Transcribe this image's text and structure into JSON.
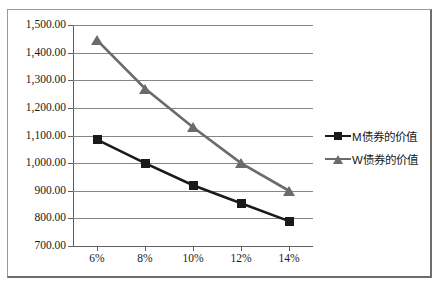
{
  "chart_data": {
    "type": "line",
    "title": "",
    "xlabel": "",
    "ylabel": "",
    "categories": [
      "6%",
      "8%",
      "10%",
      "12%",
      "14%"
    ],
    "ylim": [
      700,
      1500
    ],
    "ytick_step": 100,
    "ytick_labels": [
      "1,500.00",
      "1,400.00",
      "1,300.00",
      "1,200.00",
      "1,100.00",
      "1,000.00",
      "900.00",
      "800.00",
      "700.00"
    ],
    "ytick_values": [
      1500,
      1400,
      1300,
      1200,
      1100,
      1000,
      900,
      800,
      700
    ],
    "grid": true,
    "legend_position": "right",
    "series": [
      {
        "name": "M债券的价值",
        "marker": "square",
        "color": "#1a1a1a",
        "values": [
          1085,
          1000,
          920,
          855,
          790
        ]
      },
      {
        "name": "W债券的价值",
        "marker": "triangle",
        "color": "#6b6b6b",
        "values": [
          1445,
          1270,
          1130,
          1000,
          900
        ]
      }
    ]
  },
  "colors": {
    "series_m": "#1a1a1a",
    "series_w": "#6b6b6b",
    "grid": "#868686",
    "axis": "#5e5e5e",
    "frame": "#9a9a9a",
    "background": "#ffffff"
  }
}
